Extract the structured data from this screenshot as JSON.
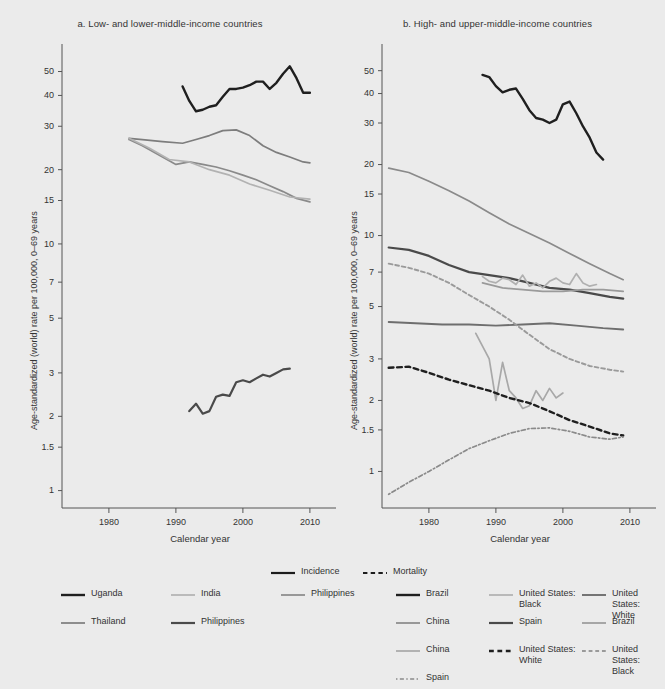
{
  "figure": {
    "background": "#ebebeb",
    "panels": [
      {
        "id": "a",
        "title": "a. Low- and lower-middle-income countries",
        "xlabel": "Calendar year",
        "ylabel": "Age-standardized (world) rate per 100,000, 0–69 years"
      },
      {
        "id": "b",
        "title": "b. High- and upper-middle-income countries",
        "xlabel": "Calendar year",
        "ylabel": "Age-standardized (world) rate per 100,000, 0–69 years"
      }
    ]
  },
  "style_legend": {
    "items": [
      {
        "label": "Incidence",
        "dash": "solid",
        "color": "#1c1c1c",
        "width": 2.2
      },
      {
        "label": "Mortality",
        "dash": "dashed",
        "color": "#1c1c1c",
        "width": 2.2
      }
    ]
  },
  "legend_a": {
    "items": [
      {
        "label": "Uganda",
        "dash": "solid",
        "color": "#1f1f1f",
        "width": 2.4,
        "col": 0,
        "row": 0
      },
      {
        "label": "India",
        "dash": "solid",
        "color": "#b2b2b2",
        "width": 1.7,
        "col": 1,
        "row": 0
      },
      {
        "label": "Philippines",
        "dash": "solid",
        "color": "#8a8a8a",
        "width": 1.7,
        "col": 2,
        "row": 0
      },
      {
        "label": "Thailand",
        "dash": "solid",
        "color": "#7d7d7d",
        "width": 1.7,
        "col": 0,
        "row": 1
      },
      {
        "label": "Philippines",
        "dash": "solid",
        "color": "#4a4a4a",
        "width": 2.2,
        "col": 1,
        "row": 1
      }
    ]
  },
  "legend_b": {
    "items": [
      {
        "label": "Brazil",
        "dash": "solid",
        "color": "#1f1f1f",
        "width": 2.4,
        "col": 0,
        "row": 0
      },
      {
        "label": "United States:\nBlack",
        "dash": "solid",
        "color": "#b0b0b0",
        "width": 1.7,
        "col": 1,
        "row": 0
      },
      {
        "label": "United States:\nWhite",
        "dash": "solid",
        "color": "#6e6e6e",
        "width": 1.9,
        "col": 2,
        "row": 0
      },
      {
        "label": "China",
        "dash": "solid",
        "color": "#8a8a8a",
        "width": 1.7,
        "col": 0,
        "row": 1
      },
      {
        "label": "Spain",
        "dash": "solid",
        "color": "#4a4a4a",
        "width": 2.2,
        "col": 1,
        "row": 1
      },
      {
        "label": "Brazil",
        "solid": true,
        "dash": "solid",
        "color": "#9a9a9a",
        "width": 1.7,
        "col": 2,
        "row": 1
      },
      {
        "label": "China",
        "dash": "solid",
        "color": "#a8a8a8",
        "width": 1.7,
        "col": 0,
        "row": 2
      },
      {
        "label": "United States:\nWhite",
        "dash": "dashed",
        "color": "#1f1f1f",
        "width": 2.4,
        "col": 1,
        "row": 2
      },
      {
        "label": "United States:\nBlack",
        "dash": "dashed",
        "color": "#9a9a9a",
        "width": 1.9,
        "col": 2,
        "row": 2
      },
      {
        "label": "Spain",
        "dash": "dotdash",
        "color": "#8a8a8a",
        "width": 1.7,
        "col": 0,
        "row": 3
      }
    ]
  },
  "chart_data": [
    {
      "type": "line",
      "panel": "a",
      "title": "a. Low- and lower-middle-income countries",
      "xlabel": "Calendar year",
      "ylabel": "Age-standardized (world) rate per 100,000, 0-69 years",
      "yscale": "log",
      "xlim": [
        1973,
        2013
      ],
      "ylim": [
        0.85,
        60
      ],
      "xticks": [
        1980,
        1990,
        2000,
        2010
      ],
      "yticks": [
        1,
        1.5,
        2,
        3,
        5,
        7,
        10,
        15,
        20,
        30,
        40,
        50
      ],
      "grid": false,
      "legend_position": "bottom",
      "series": [
        {
          "name": "Uganda",
          "measure": "Incidence",
          "dash": "solid",
          "color": "#1f1f1f",
          "width": 2.4,
          "x": [
            1991,
            1992,
            1993,
            1994,
            1995,
            1996,
            1997,
            1998,
            1999,
            2000,
            2001,
            2002,
            2003,
            2004,
            2005,
            2006,
            2007,
            2008,
            2009,
            2010
          ],
          "y": [
            43.5,
            38.0,
            34.5,
            35.0,
            36.0,
            36.5,
            39.5,
            42.5,
            42.5,
            43.0,
            44.0,
            45.5,
            45.5,
            42.5,
            45.0,
            49.0,
            52.5,
            47.0,
            41.0,
            41.0
          ]
        },
        {
          "name": "Thailand",
          "measure": "Incidence",
          "dash": "solid",
          "color": "#7d7d7d",
          "width": 1.7,
          "x": [
            1983,
            1985,
            1988,
            1991,
            1993,
            1995,
            1997,
            1999,
            2001,
            2003,
            2005,
            2007,
            2009,
            2010
          ],
          "y": [
            26.8,
            26.5,
            26.0,
            25.6,
            26.5,
            27.5,
            28.8,
            29.0,
            27.5,
            25.0,
            23.5,
            22.5,
            21.5,
            21.3
          ]
        },
        {
          "name": "Philippines",
          "measure": "Incidence",
          "dash": "solid",
          "color": "#8a8a8a",
          "width": 1.7,
          "x": [
            1983,
            1985,
            1988,
            1990,
            1992,
            1994,
            1996,
            1998,
            2000,
            2002,
            2004,
            2006,
            2008,
            2010
          ],
          "y": [
            26.5,
            25.0,
            22.5,
            21.0,
            21.5,
            21.0,
            20.5,
            19.8,
            19.0,
            18.2,
            17.2,
            16.3,
            15.3,
            14.8
          ]
        },
        {
          "name": "India",
          "measure": "Incidence",
          "dash": "solid",
          "color": "#b2b2b2",
          "width": 1.7,
          "x": [
            1983,
            1986,
            1989,
            1992,
            1995,
            1998,
            2001,
            2004,
            2007,
            2010
          ],
          "y": [
            26.8,
            24.5,
            22.0,
            21.5,
            20.0,
            19.0,
            17.5,
            16.5,
            15.5,
            15.2
          ]
        },
        {
          "name": "Philippines",
          "measure": "Mortality",
          "dash": "solid",
          "color": "#4a4a4a",
          "width": 2.2,
          "x": [
            1992,
            1993,
            1994,
            1995,
            1996,
            1997,
            1998,
            1999,
            2000,
            2001,
            2002,
            2003,
            2004,
            2005,
            2006,
            2007
          ],
          "y": [
            2.1,
            2.25,
            2.05,
            2.1,
            2.4,
            2.45,
            2.42,
            2.75,
            2.8,
            2.75,
            2.85,
            2.95,
            2.9,
            3.0,
            3.1,
            3.12
          ]
        }
      ]
    },
    {
      "type": "line",
      "panel": "b",
      "title": "b. High- and upper-middle-income countries",
      "xlabel": "Calendar year",
      "ylabel": "Age-standardized (world) rate per 100,000, 0-69 years",
      "yscale": "log",
      "xlim": [
        1973,
        2013
      ],
      "ylim": [
        0.7,
        60
      ],
      "xticks": [
        1980,
        1990,
        2000,
        2010
      ],
      "yticks": [
        1,
        1.5,
        2,
        3,
        5,
        7,
        10,
        15,
        20,
        30,
        40,
        50
      ],
      "grid": false,
      "legend_position": "bottom",
      "series": [
        {
          "name": "Brazil",
          "measure": "Incidence",
          "dash": "solid",
          "color": "#1f1f1f",
          "width": 2.4,
          "x": [
            1988,
            1989,
            1990,
            1991,
            1992,
            1993,
            1994,
            1995,
            1996,
            1997,
            1998,
            1999,
            2000,
            2001,
            2002,
            2003,
            2004,
            2005,
            2006
          ],
          "y": [
            48.0,
            47.0,
            43.0,
            40.5,
            41.5,
            42.0,
            38.0,
            34.0,
            31.5,
            31.0,
            30.0,
            31.0,
            36.0,
            37.0,
            33.0,
            29.0,
            26.0,
            22.5,
            21.0
          ]
        },
        {
          "name": "China",
          "measure": "Incidence",
          "dash": "solid",
          "color": "#8a8a8a",
          "width": 1.7,
          "x": [
            1974,
            1977,
            1980,
            1983,
            1986,
            1989,
            1992,
            1995,
            1998,
            2001,
            2004,
            2007,
            2009
          ],
          "y": [
            19.3,
            18.5,
            17.0,
            15.5,
            14.0,
            12.5,
            11.2,
            10.2,
            9.3,
            8.4,
            7.6,
            6.9,
            6.5
          ]
        },
        {
          "name": "Spain",
          "measure": "Incidence",
          "dash": "solid",
          "color": "#4a4a4a",
          "width": 2.2,
          "x": [
            1974,
            1977,
            1980,
            1983,
            1986,
            1989,
            1992,
            1995,
            1998,
            2001,
            2004,
            2007,
            2009
          ],
          "y": [
            8.9,
            8.7,
            8.2,
            7.5,
            7.0,
            6.8,
            6.6,
            6.3,
            6.0,
            5.9,
            5.7,
            5.5,
            5.4
          ]
        },
        {
          "name": "United States: White",
          "measure": "Incidence",
          "dash": "solid",
          "color": "#6e6e6e",
          "width": 1.9,
          "x": [
            1974,
            1978,
            1982,
            1986,
            1990,
            1994,
            1998,
            2002,
            2006,
            2009
          ],
          "y": [
            4.3,
            4.25,
            4.2,
            4.2,
            4.15,
            4.2,
            4.25,
            4.15,
            4.05,
            4.0
          ]
        },
        {
          "name": "United States: Black",
          "measure": "Incidence",
          "dash": "solid",
          "color": "#b0b0b0",
          "width": 1.7,
          "x": [
            1988,
            1989,
            1990,
            1991,
            1992,
            1993,
            1994,
            1995,
            1996,
            1997,
            1998,
            1999,
            2000,
            2001,
            2002,
            2003,
            2004,
            2005
          ],
          "y": [
            6.7,
            6.4,
            6.3,
            6.6,
            6.5,
            6.2,
            6.8,
            6.1,
            6.3,
            6.0,
            6.4,
            6.6,
            6.3,
            6.2,
            6.9,
            6.3,
            6.1,
            6.2
          ]
        },
        {
          "name": "Brazil",
          "measure": "Mortality-solid",
          "dash": "solid",
          "color": "#9a9a9a",
          "width": 1.7,
          "x": [
            1988,
            1991,
            1994,
            1997,
            2000,
            2003,
            2006,
            2009
          ],
          "y": [
            6.3,
            6.0,
            5.9,
            5.8,
            5.8,
            5.9,
            5.9,
            5.8
          ]
        },
        {
          "name": "China",
          "measure": "Mortality",
          "dash": "solid",
          "color": "#a8a8a8",
          "width": 1.7,
          "x": [
            1987,
            1988,
            1989,
            1990,
            1991,
            1992,
            1993,
            1994,
            1995,
            1996,
            1997,
            1998,
            1999,
            2000
          ],
          "y": [
            3.85,
            3.4,
            3.0,
            2.0,
            2.9,
            2.2,
            2.05,
            1.85,
            1.9,
            2.2,
            2.0,
            2.25,
            2.05,
            2.15
          ]
        },
        {
          "name": "United States: White",
          "measure": "Mortality",
          "dash": "dashed",
          "color": "#1f1f1f",
          "width": 2.4,
          "x": [
            1974,
            1977,
            1980,
            1983,
            1986,
            1989,
            1992,
            1995,
            1998,
            2001,
            2004,
            2007,
            2009
          ],
          "y": [
            2.75,
            2.78,
            2.62,
            2.45,
            2.32,
            2.2,
            2.05,
            1.95,
            1.8,
            1.65,
            1.55,
            1.45,
            1.42
          ]
        },
        {
          "name": "United States: Black",
          "measure": "Mortality",
          "dash": "dashed",
          "color": "#9a9a9a",
          "width": 1.9,
          "x": [
            1974,
            1977,
            1980,
            1983,
            1986,
            1989,
            1992,
            1995,
            1998,
            2001,
            2004,
            2007,
            2009
          ],
          "y": [
            7.6,
            7.3,
            6.9,
            6.3,
            5.6,
            5.0,
            4.4,
            3.8,
            3.3,
            3.0,
            2.8,
            2.7,
            2.65
          ]
        },
        {
          "name": "Spain",
          "measure": "Mortality",
          "dash": "dotdash",
          "color": "#8a8a8a",
          "width": 1.7,
          "x": [
            1974,
            1977,
            1980,
            1983,
            1986,
            1989,
            1992,
            1995,
            1998,
            2001,
            2004,
            2007,
            2009
          ],
          "y": [
            0.8,
            0.9,
            1.0,
            1.12,
            1.25,
            1.35,
            1.45,
            1.52,
            1.53,
            1.48,
            1.4,
            1.37,
            1.4
          ]
        }
      ]
    }
  ]
}
